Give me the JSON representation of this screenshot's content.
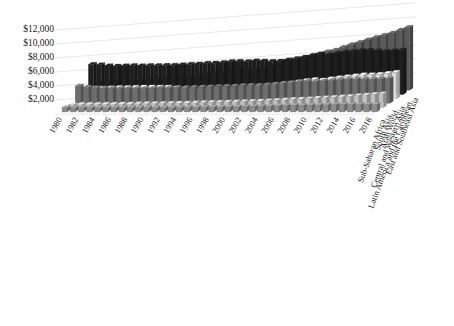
{
  "chart_data": {
    "type": "bar",
    "subtype": "3d-grouped-bar",
    "title": "",
    "subtitle": "",
    "xlabel": "",
    "ylabel": "",
    "zlabel": "",
    "grid": true,
    "legend_position": "depth-axis-right",
    "ylim": [
      0,
      12000
    ],
    "ytick_labels": [
      "$2,000",
      "$4,000",
      "$6,000",
      "$8,000",
      "$10,000",
      "$12,000"
    ],
    "ytick_values": [
      2000,
      4000,
      6000,
      8000,
      10000,
      12000
    ],
    "x": [
      1980,
      1981,
      1982,
      1983,
      1984,
      1985,
      1986,
      1987,
      1988,
      1989,
      1990,
      1991,
      1992,
      1993,
      1994,
      1995,
      1996,
      1997,
      1998,
      1999,
      2000,
      2001,
      2002,
      2003,
      2004,
      2005,
      2006,
      2007,
      2008,
      2009,
      2010,
      2011,
      2012,
      2013,
      2014,
      2015,
      2016,
      2017,
      2018
    ],
    "xtick_labels": [
      "1980",
      "1982",
      "1984",
      "1986",
      "1988",
      "1990",
      "1992",
      "1994",
      "1996",
      "1998",
      "2000",
      "2002",
      "2004",
      "2006",
      "2008",
      "2010",
      "2012",
      "2014",
      "2016",
      "2018"
    ],
    "xtick_values": [
      1980,
      1982,
      1984,
      1986,
      1988,
      1990,
      1992,
      1994,
      1996,
      1998,
      2000,
      2002,
      2004,
      2006,
      2008,
      2010,
      2012,
      2014,
      2016,
      2018
    ],
    "series": [
      {
        "name": "Sub-Saharan Africa",
        "color": "#8c8c8c",
        "values": [
          620,
          610,
          600,
          590,
          585,
          590,
          600,
          610,
          620,
          625,
          630,
          625,
          620,
          615,
          620,
          635,
          650,
          665,
          675,
          685,
          700,
          715,
          730,
          750,
          780,
          815,
          855,
          895,
          925,
          920,
          950,
          975,
          1000,
          1020,
          1045,
          1040,
          1030,
          1045,
          1060
        ]
      },
      {
        "name": "South Asia",
        "color": "#bfbfbf",
        "values": [
          400,
          410,
          425,
          440,
          455,
          470,
          485,
          500,
          530,
          555,
          575,
          585,
          605,
          625,
          650,
          680,
          710,
          735,
          765,
          800,
          825,
          855,
          880,
          925,
          975,
          1035,
          1095,
          1165,
          1200,
          1265,
          1345,
          1405,
          1455,
          1525,
          1610,
          1705,
          1800,
          1890,
          1970
        ]
      },
      {
        "name": "Arab World",
        "color": "#6e6e6e",
        "values": [
          2450,
          2300,
          2200,
          2150,
          2120,
          2100,
          2080,
          2090,
          2100,
          2130,
          2200,
          2180,
          2230,
          2240,
          2260,
          2290,
          2340,
          2390,
          2400,
          2430,
          2520,
          2540,
          2570,
          2640,
          2740,
          2860,
          2960,
          3050,
          3140,
          3090,
          3170,
          3240,
          3320,
          3360,
          3400,
          3390,
          3390,
          3440,
          3500
        ]
      },
      {
        "name": "Central and Western Asia",
        "color": "#d9d9d9",
        "values": [
          1500,
          1520,
          1550,
          1570,
          1600,
          1620,
          1650,
          1670,
          1690,
          1700,
          1680,
          1560,
          1420,
          1340,
          1290,
          1280,
          1320,
          1370,
          1400,
          1450,
          1560,
          1670,
          1780,
          1900,
          2060,
          2230,
          2420,
          2620,
          2760,
          2690,
          2850,
          3020,
          3160,
          3290,
          3420,
          3440,
          3490,
          3640,
          3790
        ]
      },
      {
        "name": "Latin America and the Caribbean",
        "color": "#1f1f1f",
        "values": [
          4300,
          4250,
          4100,
          4050,
          4080,
          4120,
          4100,
          4150,
          4120,
          4160,
          4180,
          4240,
          4300,
          4360,
          4460,
          4480,
          4560,
          4690,
          4740,
          4700,
          4800,
          4790,
          4740,
          4780,
          4950,
          5120,
          5340,
          5580,
          5760,
          5650,
          5880,
          6060,
          6180,
          6280,
          6320,
          6240,
          6170,
          6250,
          6330
        ]
      },
      {
        "name": "East and Southeast Asia",
        "color": "#595959",
        "values": [
          1050,
          1090,
          1140,
          1200,
          1280,
          1360,
          1430,
          1530,
          1650,
          1740,
          1820,
          1930,
          2070,
          2230,
          2400,
          2560,
          2720,
          2870,
          2930,
          3060,
          3230,
          3390,
          3580,
          3830,
          4120,
          4430,
          4790,
          5180,
          5490,
          5720,
          6130,
          6500,
          6830,
          7180,
          7530,
          7830,
          8160,
          8570,
          8980
        ]
      }
    ]
  },
  "axes": {
    "y_axis_name": "value-axis",
    "x_axis_name": "year-axis",
    "z_axis_name": "region-axis"
  }
}
